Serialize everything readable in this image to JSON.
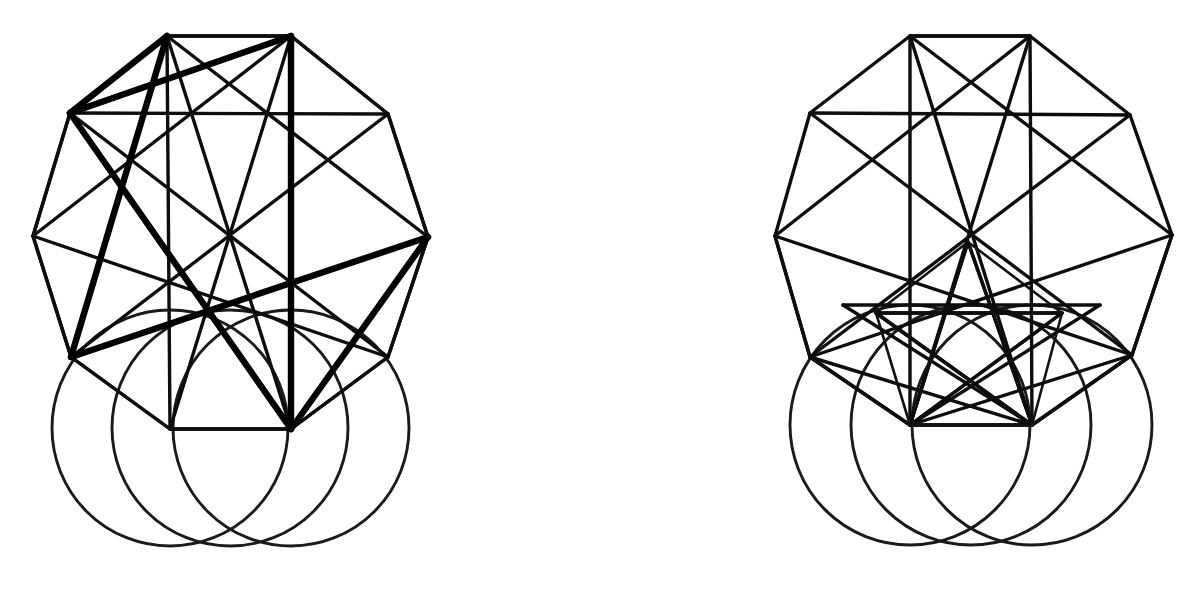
{
  "meta": {
    "canvas_width": 1201,
    "canvas_height": 591,
    "background_color": "#ffffff",
    "ink_color": "#000000",
    "figure_count": 2
  },
  "figures": [
    {
      "id": "left-figure",
      "name": "left-geometric-construction",
      "label": "Left construction — bold pentagram over decagon with three circles",
      "decagon": {
        "name": "decagon-outline",
        "vertex_count": 10,
        "points": [
          [
            167,
            36
          ],
          [
            291,
            36
          ],
          [
            388,
            114
          ],
          [
            428,
            237
          ],
          [
            388,
            357
          ],
          [
            291,
            429
          ],
          [
            170,
            429
          ],
          [
            71,
            357
          ],
          [
            33,
            236
          ],
          [
            70,
            113
          ]
        ]
      },
      "rectangle": {
        "name": "inner-rectangle",
        "points": [
          [
            167,
            36
          ],
          [
            291,
            36
          ],
          [
            291,
            429
          ],
          [
            170,
            429
          ]
        ]
      },
      "chords_thin": [
        [
          [
            167,
            36
          ],
          [
            291,
            429
          ]
        ],
        [
          [
            291,
            36
          ],
          [
            170,
            429
          ]
        ],
        [
          [
            70,
            113
          ],
          [
            388,
            114
          ]
        ],
        [
          [
            70,
            113
          ],
          [
            33,
            236
          ]
        ],
        [
          [
            388,
            114
          ],
          [
            428,
            237
          ]
        ],
        [
          [
            33,
            236
          ],
          [
            71,
            357
          ]
        ],
        [
          [
            428,
            237
          ],
          [
            388,
            357
          ]
        ],
        [
          [
            71,
            357
          ],
          [
            170,
            429
          ]
        ],
        [
          [
            388,
            357
          ],
          [
            291,
            429
          ]
        ],
        [
          [
            167,
            36
          ],
          [
            70,
            113
          ]
        ],
        [
          [
            291,
            36
          ],
          [
            388,
            114
          ]
        ],
        [
          [
            33,
            236
          ],
          [
            291,
            36
          ]
        ],
        [
          [
            428,
            237
          ],
          [
            167,
            36
          ]
        ],
        [
          [
            71,
            357
          ],
          [
            388,
            114
          ]
        ],
        [
          [
            388,
            357
          ],
          [
            70,
            113
          ]
        ],
        [
          [
            33,
            236
          ],
          [
            388,
            357
          ]
        ],
        [
          [
            428,
            237
          ],
          [
            71,
            357
          ]
        ]
      ],
      "pentagram_bold": {
        "name": "bold-pentagram",
        "points": [
          [
            70,
            113
          ],
          [
            428,
            237
          ],
          [
            167,
            36
          ],
          [
            291,
            429
          ],
          [
            71,
            357
          ]
        ]
      },
      "bold_extras": [
        [
          [
            291,
            36
          ],
          [
            291,
            429
          ]
        ],
        [
          [
            70,
            113
          ],
          [
            291,
            36
          ]
        ]
      ],
      "circles": [
        {
          "name": "circle-left",
          "cx": 170,
          "cy": 428,
          "r": 118
        },
        {
          "name": "circle-right",
          "cx": 291,
          "cy": 428,
          "r": 118
        },
        {
          "name": "circle-middle",
          "cx": 230,
          "cy": 428,
          "r": 118
        }
      ]
    },
    {
      "id": "right-figure",
      "name": "right-geometric-construction",
      "label": "Right construction — nested inner star over decagon with three circles",
      "decagon": {
        "name": "decagon-outline",
        "vertex_count": 10,
        "points": [
          [
            910,
            36
          ],
          [
            1030,
            36
          ],
          [
            1130,
            115
          ],
          [
            1172,
            235
          ],
          [
            1132,
            355
          ],
          [
            1032,
            425
          ],
          [
            910,
            425
          ],
          [
            810,
            357
          ],
          [
            775,
            236
          ],
          [
            810,
            113
          ]
        ]
      },
      "rectangle": {
        "name": "inner-rectangle",
        "points": [
          [
            910,
            36
          ],
          [
            1030,
            36
          ],
          [
            1032,
            425
          ],
          [
            910,
            425
          ]
        ]
      },
      "chords_thin": [
        [
          [
            910,
            36
          ],
          [
            1032,
            425
          ]
        ],
        [
          [
            1030,
            36
          ],
          [
            910,
            425
          ]
        ],
        [
          [
            810,
            113
          ],
          [
            1130,
            115
          ]
        ],
        [
          [
            775,
            236
          ],
          [
            1030,
            36
          ]
        ],
        [
          [
            1172,
            235
          ],
          [
            910,
            36
          ]
        ],
        [
          [
            810,
            357
          ],
          [
            1130,
            115
          ]
        ],
        [
          [
            1132,
            355
          ],
          [
            810,
            113
          ]
        ],
        [
          [
            775,
            236
          ],
          [
            1132,
            355
          ]
        ],
        [
          [
            1172,
            235
          ],
          [
            810,
            357
          ]
        ],
        [
          [
            810,
            357
          ],
          [
            910,
            425
          ]
        ],
        [
          [
            1132,
            355
          ],
          [
            1032,
            425
          ]
        ],
        [
          [
            775,
            236
          ],
          [
            810,
            357
          ]
        ],
        [
          [
            1172,
            235
          ],
          [
            1132,
            355
          ]
        ]
      ],
      "inner_star": {
        "name": "inner-star-polygon",
        "apex": [
          968,
          242
        ],
        "points": [
          [
            968,
            242
          ],
          [
            1062,
            313
          ],
          [
            1032,
            425
          ],
          [
            910,
            425
          ],
          [
            876,
            313
          ]
        ]
      },
      "inner_fan": [
        [
          [
            910,
            425
          ],
          [
            968,
            242
          ]
        ],
        [
          [
            1032,
            425
          ],
          [
            968,
            242
          ]
        ],
        [
          [
            910,
            425
          ],
          [
            1062,
            313
          ]
        ],
        [
          [
            1032,
            425
          ],
          [
            876,
            313
          ]
        ],
        [
          [
            876,
            313
          ],
          [
            1062,
            313
          ]
        ],
        [
          [
            910,
            425
          ],
          [
            1100,
            305
          ]
        ],
        [
          [
            1032,
            425
          ],
          [
            843,
            305
          ]
        ],
        [
          [
            843,
            305
          ],
          [
            1100,
            305
          ]
        ],
        [
          [
            910,
            425
          ],
          [
            1132,
            355
          ]
        ],
        [
          [
            1032,
            425
          ],
          [
            810,
            357
          ]
        ]
      ],
      "circles": [
        {
          "name": "circle-left",
          "cx": 910,
          "cy": 425,
          "r": 120
        },
        {
          "name": "circle-right",
          "cx": 1032,
          "cy": 425,
          "r": 120
        },
        {
          "name": "circle-middle",
          "cx": 971,
          "cy": 425,
          "r": 120
        }
      ]
    }
  ]
}
